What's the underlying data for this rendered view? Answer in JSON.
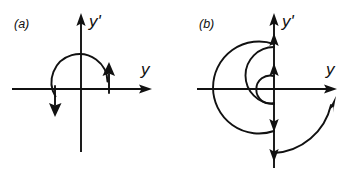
{
  "figure": {
    "background_color": "#ffffff",
    "ink_color": "#111111",
    "panels": [
      {
        "id": "a",
        "caption": "(a)",
        "axes": {
          "horizontal_label": "y",
          "vertical_label": "y'",
          "origin": {
            "x": 81,
            "y": 89
          },
          "horizontal_extent": [
            12,
            152
          ],
          "vertical_extent": [
            13,
            152
          ],
          "horizontal_arrow": "right",
          "vertical_arrow": "up"
        },
        "trajectory": {
          "kind": "closed-orbit",
          "description": "single closed circular orbit centered on origin",
          "radius": 28,
          "direction": "clockwise",
          "arrowheads": [
            {
              "position": "right",
              "points": "up"
            },
            {
              "position": "left",
              "points": "down"
            }
          ]
        }
      },
      {
        "id": "b",
        "caption": "(b)",
        "axes": {
          "horizontal_label": "y",
          "vertical_label": "y'",
          "origin": {
            "x": 95,
            "y": 89
          },
          "horizontal_extent": [
            18,
            158
          ],
          "vertical_extent": [
            13,
            168
          ],
          "horizontal_arrow": "right",
          "vertical_arrow": "up"
        },
        "trajectory": {
          "kind": "outward-spiral",
          "description": "growing spiral of semicircular arcs with increasing radius",
          "radii": [
            14,
            28,
            46,
            62
          ],
          "direction": "clockwise",
          "arrowheads": [
            {
              "position": "vertical-axis-inner-up",
              "points": "up"
            },
            {
              "position": "vertical-axis-upper",
              "points": "up"
            },
            {
              "position": "vertical-axis-lower",
              "points": "down"
            },
            {
              "position": "vertical-axis-bottom",
              "points": "down"
            },
            {
              "position": "outer-lower-right-arc",
              "points": "up-right"
            }
          ]
        }
      }
    ]
  }
}
